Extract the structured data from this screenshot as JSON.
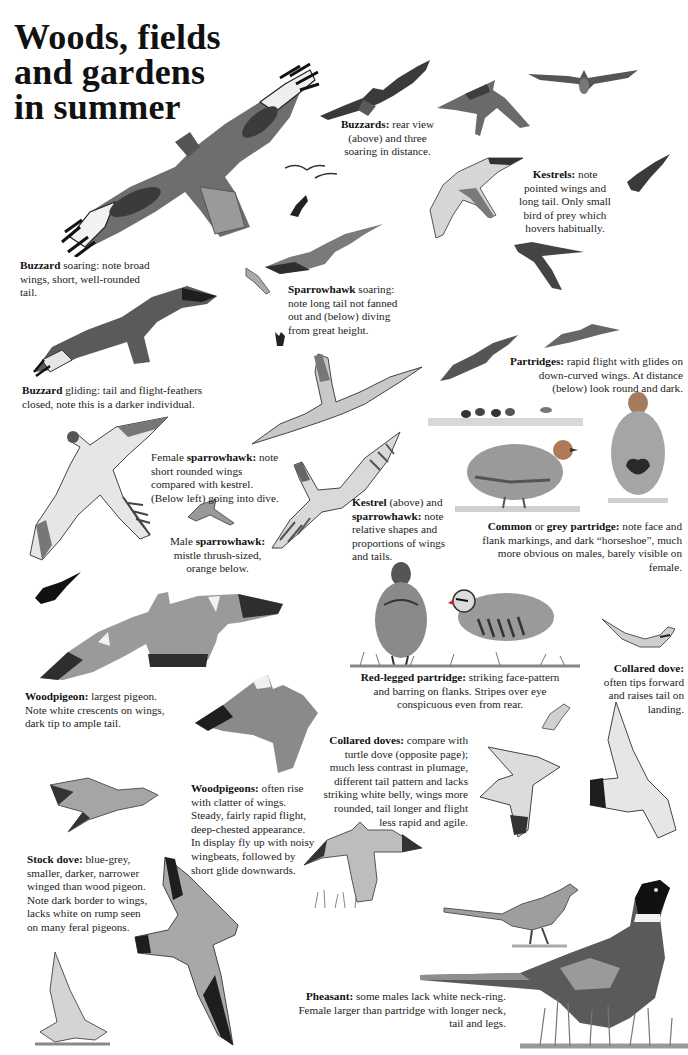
{
  "page": {
    "title_lines": [
      "Woods, fields",
      "and gardens",
      "in summer"
    ]
  },
  "captions": {
    "buzzards_rear": {
      "bold": "Buzzards:",
      "text": " rear view (above) and three soaring in distance."
    },
    "kestrels": {
      "bold": "Kestrels:",
      "text": " note pointed wings and long tail. Only small bird of prey which hovers habitually."
    },
    "buzzard_soaring": {
      "bold": "Buzzard",
      "text": " soaring: note broad wings, short, well-rounded tail."
    },
    "sparrowhawk_soaring": {
      "bold": "Sparrowhawk",
      "text": " soaring: note long tail not fanned out and (below) diving from great height."
    },
    "buzzard_gliding": {
      "bold": "Buzzard",
      "text": " gliding: tail and flight-feathers closed, note this is a darker individual."
    },
    "partridges": {
      "bold": "Partridges:",
      "text": " rapid flight with glides on down-curved wings. At distance (below) look round and dark."
    },
    "female_sparrowhawk": {
      "pre": "Female ",
      "bold": "sparrowhawk:",
      "text": " note short rounded wings compared with kestrel. (Below left) going into dive."
    },
    "male_sparrowhawk": {
      "pre": "Male ",
      "bold": "sparrowhawk:",
      "text": " mistle thrush-sized, orange below."
    },
    "kestrel_and_sparrowhawk": {
      "bold": "Kestrel",
      "mid": " (above) and ",
      "bold2": "sparrowhawk:",
      "text": " note relative shapes and proportions of wings and tails."
    },
    "grey_partridge": {
      "bold": "Common",
      "mid": " or ",
      "bold2": "grey partridge:",
      "text": " note face and flank markings, and dark “horseshoe”, much more obvious on males, barely visible on female."
    },
    "red_legged_partridge": {
      "bold": "Red-legged partridge:",
      "text": " striking face-pattern and barring on flanks. Stripes over eye conspicuous even from rear."
    },
    "collared_dove": {
      "bold": "Collared dove:",
      "text": " often tips forward and raises tail on landing."
    },
    "woodpigeon": {
      "bold": "Woodpigeon:",
      "text": " largest pigeon. Note white crescents on wings, dark tip to ample tail."
    },
    "collared_doves": {
      "bold": "Collared doves:",
      "text": " compare with turtle dove (opposite page); much less contrast in plumage, different tail pattern and lacks striking white belly, wings more rounded, tail longer and flight less rapid and agile."
    },
    "woodpigeons": {
      "bold": "Woodpigeons:",
      "text": " often rise with clatter of wings. Steady, fairly rapid flight, deep-chested appearance. In display fly up with noisy wingbeats, followed by short glide downwards."
    },
    "stock_dove": {
      "bold": "Stock dove:",
      "text": " blue-grey, smaller, darker, narrower winged than wood pigeon. Note dark border to wings, lacks white on rump seen on many feral pigeons."
    },
    "pheasant": {
      "bold": "Pheasant:",
      "text": " some males lack white neck-ring. Female larger than partridge with longer neck, tail and legs."
    }
  },
  "illustrations": [
    "buzzard-soaring-large",
    "buzzard-rear-view",
    "buzzard-distant-1",
    "buzzard-distant-2",
    "buzzard-distant-3",
    "kestrel-hovering",
    "kestrel-flying",
    "kestrel-small-right",
    "kestrel-diving",
    "sparrowhawk-soaring",
    "sparrowhawk-small",
    "sparrowhawk-diving",
    "buzzard-gliding",
    "kestrel-above",
    "sparrowhawk-female",
    "sparrowhawk-male",
    "partridge-flying-1",
    "partridge-flying-2",
    "partridges-distant",
    "grey-partridge-side",
    "grey-partridge-front",
    "red-legged-partridge-rear",
    "red-legged-partridge-side",
    "woodpigeon-large",
    "woodpigeon-rising",
    "woodpigeon-gliding",
    "stock-dove-flying",
    "stock-dove-landing",
    "collared-dove-landing",
    "collared-dove-flying-1",
    "collared-dove-flying-2",
    "collared-dove-tail",
    "pheasant-female",
    "pheasant-male"
  ],
  "colors": {
    "ink": "#1e1e1e",
    "grey_mid": "#8a8a8a",
    "grey_light": "#c9c9c9",
    "grey_dark": "#3a3a3a"
  }
}
